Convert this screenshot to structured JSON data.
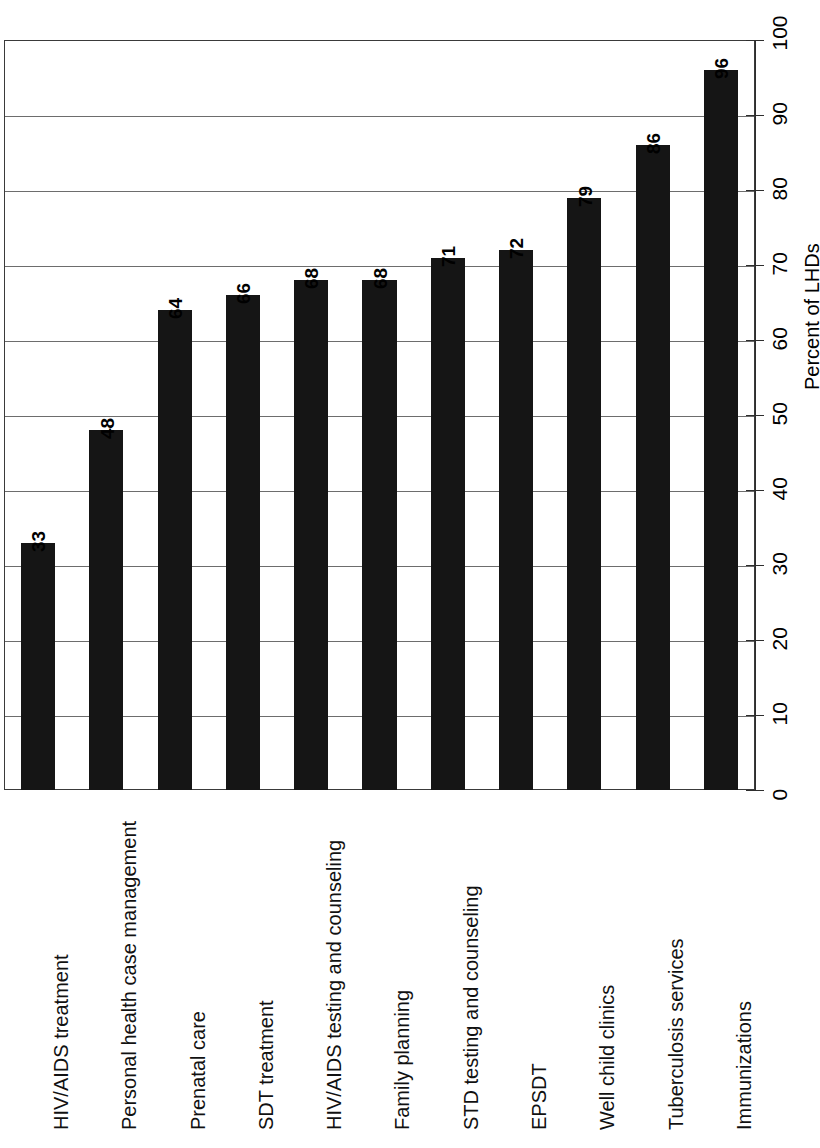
{
  "chart_data": {
    "type": "bar",
    "orientation": "rotated-90",
    "title": "",
    "xlabel": "",
    "ylabel": "Percent of LHDs",
    "ylim": [
      0,
      100
    ],
    "ytick_step": 10,
    "grid": true,
    "legend": "none",
    "categories": [
      "HIV/AIDS treatment",
      "Personal health case management",
      "Prenatal care",
      "SDT treatment",
      "HIV/AIDS testing and counseling",
      "Family planning",
      "STD testing and counseling",
      "EPSDT",
      "Well child clinics",
      "Tuberculosis services",
      "Immunizations"
    ],
    "values": [
      33,
      48,
      64,
      66,
      68,
      68,
      71,
      72,
      79,
      86,
      96
    ],
    "tick_labels": [
      "0",
      "10",
      "20",
      "30",
      "40",
      "50",
      "60",
      "70",
      "80",
      "90",
      "100"
    ],
    "tick_values": [
      0,
      10,
      20,
      30,
      40,
      50,
      60,
      70,
      80,
      90,
      100
    ],
    "bar_color": "#151515",
    "grid_color": "#6d6d6d",
    "frame_color": "#3a3a3a",
    "axis_color": "#2e2e2e",
    "background": "#ffffff"
  }
}
